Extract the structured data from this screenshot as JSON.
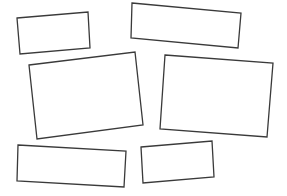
{
  "canvas": {
    "width": 287,
    "height": 196,
    "background": "#ffffff"
  },
  "style": {
    "stroke": "#3a3a3a",
    "fill": "#ffffff",
    "stroke_width": 1.3
  },
  "shapes": [
    {
      "name": "rectangle-1",
      "points": "17,18 88,12 90,48 20,54"
    },
    {
      "name": "rectangle-2",
      "points": "132,3 241,13 238,48 131,38"
    },
    {
      "name": "rectangle-3",
      "points": "29,65 135,52 143,125 37,139"
    },
    {
      "name": "rectangle-4",
      "points": "165,55 273,63 267,137 160,129"
    },
    {
      "name": "rectangle-5",
      "points": "18,145 126,151 124,187 17,181"
    },
    {
      "name": "rectangle-6",
      "points": "141,147 212,141 214,177 143,183"
    }
  ]
}
